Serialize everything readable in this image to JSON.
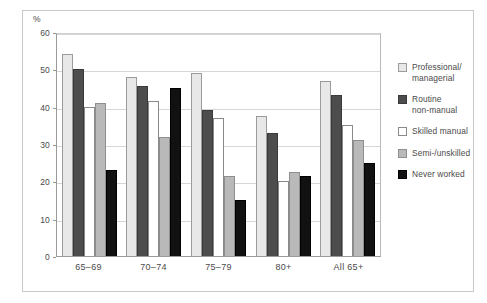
{
  "chart_data": {
    "type": "bar",
    "title": "",
    "subtitle": "",
    "xlabel": "",
    "ylabel": "",
    "unit_label": "%",
    "categories": [
      "65–69",
      "70–74",
      "75–79",
      "80+",
      "All 65+"
    ],
    "series": [
      {
        "name": "Professional/\nmanagerial",
        "legend_label": "Professional/\nmanagerial",
        "color": "#e8e8e8",
        "values": [
          54,
          48,
          49,
          37.5,
          47
        ]
      },
      {
        "name": "Routine\nnon-manual",
        "legend_label": "Routine\nnon-manual",
        "color": "#4d4d4d",
        "values": [
          50,
          45.5,
          39,
          33,
          43
        ]
      },
      {
        "name": "Skilled manual",
        "legend_label": "Skilled manual",
        "color": "#ffffff",
        "values": [
          40,
          41.5,
          37,
          20,
          35
        ]
      },
      {
        "name": "Semi-/unskilled",
        "legend_label": "Semi-/unskilled",
        "color": "#b9b9b9",
        "values": [
          41,
          32,
          21.5,
          22.5,
          31
        ]
      },
      {
        "name": "Never worked",
        "legend_label": "Never worked",
        "color": "#111111",
        "values": [
          23,
          45,
          15,
          21.5,
          25
        ]
      }
    ],
    "ylim": [
      0,
      60
    ],
    "yticks": [
      0,
      10,
      20,
      30,
      40,
      50,
      60
    ],
    "ytick_labels": [
      "0",
      "10",
      "20",
      "30",
      "40",
      "50",
      "60"
    ],
    "grid": true,
    "legend_position": "right"
  }
}
